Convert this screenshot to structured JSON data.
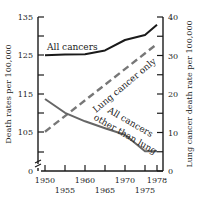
{
  "chart_data": {
    "type": "line",
    "title": "",
    "xlabel": "",
    "ylabel_left": "Death rates per 100,000",
    "ylabel_right": "Lung cancer death rate per 100,000",
    "x_ticks": [
      1950,
      1955,
      1960,
      1965,
      1970,
      1975,
      1978
    ],
    "x_tick_labels_row1": [
      "1950",
      "1960",
      "1970",
      "1978"
    ],
    "x_tick_labels_row2": [
      "1955",
      "1965",
      "1975"
    ],
    "y_left_ticks": [
      "0",
      "105",
      "115",
      "125",
      "135"
    ],
    "y_left_range": [
      105,
      135
    ],
    "y_left_axis_break": true,
    "y_right_ticks": [
      "0",
      "10",
      "20",
      "30",
      "40"
    ],
    "y_right_range": [
      0,
      40
    ],
    "grid": false,
    "legend": "inline labels",
    "series": [
      {
        "name": "All cancers",
        "axis": "left",
        "style": "solid",
        "color": "#1a1a1a",
        "x": [
          1950,
          1955,
          1960,
          1965,
          1970,
          1975,
          1978
        ],
        "values": [
          125.0,
          125.2,
          125.3,
          126.3,
          129.0,
          130.3,
          133.0
        ]
      },
      {
        "name": "Lung cancer only",
        "axis": "right",
        "style": "dashed",
        "color": "#777777",
        "x": [
          1950,
          1978
        ],
        "values": [
          10.2,
          33.0
        ]
      },
      {
        "name": "All cancers other than lung",
        "axis": "left",
        "style": "solid",
        "color": "#666666",
        "x": [
          1950,
          1955,
          1960,
          1965,
          1970,
          1975,
          1978
        ],
        "values": [
          113.6,
          110.0,
          107.8,
          106.0,
          104.3,
          100.0,
          100.0
        ]
      }
    ],
    "annotations": [
      {
        "text": "All cancers",
        "series": 0
      },
      {
        "text": "Lung cancer only",
        "series": 1
      },
      {
        "text": "All cancers",
        "series": 2,
        "line": 1
      },
      {
        "text": "other than lung",
        "series": 2,
        "line": 2
      }
    ]
  }
}
